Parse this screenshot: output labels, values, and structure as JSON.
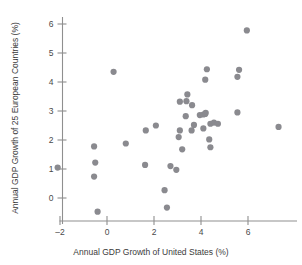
{
  "chart_data": {
    "type": "scatter",
    "title": "",
    "xlabel": "Annual GDP Growth of United States (%)",
    "ylabel": "Annual GDP Growth of 25 European Countries (%)",
    "xlim": [
      -2.9,
      7.9
    ],
    "ylim": [
      -0.95,
      6.45
    ],
    "xticks": [
      -2,
      0,
      2,
      4,
      6
    ],
    "xtick_labels": [
      "–2",
      "0",
      "2",
      "4",
      "6"
    ],
    "yticks": [
      0,
      1,
      2,
      3,
      4,
      5,
      6
    ],
    "ytick_labels": [
      "0",
      "1",
      "2",
      "3",
      "4",
      "5",
      "6"
    ],
    "grid": false,
    "legend": null,
    "marker_color": "#8a8a8f",
    "marker_size": 3.1,
    "axis_color": "#8f8f8f",
    "points": [
      {
        "x": -2.1,
        "y": 1.05
      },
      {
        "x": -0.55,
        "y": 1.78
      },
      {
        "x": -0.5,
        "y": 1.22
      },
      {
        "x": -0.55,
        "y": 0.74
      },
      {
        "x": -0.4,
        "y": -0.47
      },
      {
        "x": 0.28,
        "y": 4.35
      },
      {
        "x": 0.8,
        "y": 1.88
      },
      {
        "x": 1.65,
        "y": 2.33
      },
      {
        "x": 1.62,
        "y": 1.14
      },
      {
        "x": 2.08,
        "y": 2.5
      },
      {
        "x": 2.45,
        "y": 0.27
      },
      {
        "x": 2.55,
        "y": -0.33
      },
      {
        "x": 2.7,
        "y": 1.1
      },
      {
        "x": 2.95,
        "y": 0.97
      },
      {
        "x": 3.05,
        "y": 2.1
      },
      {
        "x": 3.1,
        "y": 3.32
      },
      {
        "x": 3.1,
        "y": 2.33
      },
      {
        "x": 3.2,
        "y": 1.68
      },
      {
        "x": 3.42,
        "y": 3.57
      },
      {
        "x": 3.35,
        "y": 2.82
      },
      {
        "x": 3.38,
        "y": 3.34
      },
      {
        "x": 3.62,
        "y": 3.2
      },
      {
        "x": 3.7,
        "y": 2.52
      },
      {
        "x": 3.6,
        "y": 2.33
      },
      {
        "x": 3.95,
        "y": 2.86
      },
      {
        "x": 4.1,
        "y": 2.88
      },
      {
        "x": 4.2,
        "y": 2.94
      },
      {
        "x": 4.18,
        "y": 2.9
      },
      {
        "x": 4.1,
        "y": 2.4
      },
      {
        "x": 4.25,
        "y": 4.44
      },
      {
        "x": 4.18,
        "y": 4.08
      },
      {
        "x": 4.35,
        "y": 2.02
      },
      {
        "x": 4.4,
        "y": 2.56
      },
      {
        "x": 4.4,
        "y": 1.75
      },
      {
        "x": 4.55,
        "y": 2.6
      },
      {
        "x": 4.72,
        "y": 2.56
      },
      {
        "x": 5.62,
        "y": 4.42
      },
      {
        "x": 5.55,
        "y": 4.18
      },
      {
        "x": 5.55,
        "y": 2.95
      },
      {
        "x": 5.95,
        "y": 5.78
      },
      {
        "x": 7.3,
        "y": 2.45
      }
    ]
  }
}
